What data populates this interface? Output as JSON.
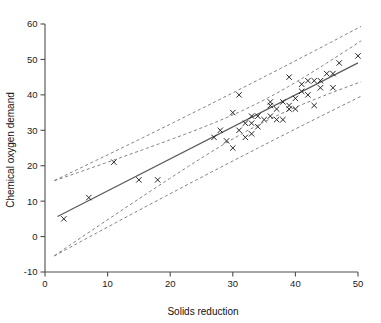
{
  "chart_data": {
    "type": "scatter",
    "title": "",
    "xlabel": "Solids reduction",
    "ylabel": "Chemical oxygen demand",
    "xlim": [
      0,
      50
    ],
    "ylim": [
      -10,
      60
    ],
    "xticks": [
      0,
      10,
      20,
      30,
      40,
      50
    ],
    "yticks": [
      -10,
      0,
      10,
      20,
      30,
      40,
      50,
      60
    ],
    "xtick_labels": [
      "0",
      "10",
      "20",
      "30",
      "40",
      "50"
    ],
    "ytick_labels": [
      "-10",
      "0",
      "10",
      "20",
      "30",
      "40",
      "50",
      "60"
    ],
    "grid": false,
    "legend": false,
    "marker": "x",
    "points": [
      {
        "x": 3.0,
        "y": 5.0
      },
      {
        "x": 7.0,
        "y": 11.0
      },
      {
        "x": 11.0,
        "y": 21.0
      },
      {
        "x": 15.0,
        "y": 16.0
      },
      {
        "x": 18.0,
        "y": 16.0
      },
      {
        "x": 27.0,
        "y": 28.0
      },
      {
        "x": 29.0,
        "y": 27.0
      },
      {
        "x": 30.0,
        "y": 25.0
      },
      {
        "x": 30.0,
        "y": 35.0
      },
      {
        "x": 31.0,
        "y": 30.0
      },
      {
        "x": 31.0,
        "y": 40.0
      },
      {
        "x": 32.0,
        "y": 32.0
      },
      {
        "x": 33.0,
        "y": 34.0
      },
      {
        "x": 33.0,
        "y": 32.0
      },
      {
        "x": 34.0,
        "y": 34.0
      },
      {
        "x": 36.0,
        "y": 37.0
      },
      {
        "x": 36.0,
        "y": 38.0
      },
      {
        "x": 36.0,
        "y": 34.0
      },
      {
        "x": 37.0,
        "y": 36.0
      },
      {
        "x": 38.0,
        "y": 38.0
      },
      {
        "x": 39.0,
        "y": 37.0
      },
      {
        "x": 39.0,
        "y": 36.0
      },
      {
        "x": 39.0,
        "y": 45.0
      },
      {
        "x": 40.0,
        "y": 39.0
      },
      {
        "x": 41.0,
        "y": 41.0
      },
      {
        "x": 42.0,
        "y": 40.0
      },
      {
        "x": 42.0,
        "y": 44.0
      },
      {
        "x": 43.0,
        "y": 37.0
      },
      {
        "x": 44.0,
        "y": 44.0
      },
      {
        "x": 45.0,
        "y": 46.0
      },
      {
        "x": 46.0,
        "y": 46.0
      },
      {
        "x": 47.0,
        "y": 49.0
      },
      {
        "x": 50.0,
        "y": 51.0
      },
      {
        "x": 28.0,
        "y": 30.0
      },
      {
        "x": 34.0,
        "y": 31.0
      },
      {
        "x": 35.0,
        "y": 33.0
      },
      {
        "x": 37.0,
        "y": 33.0
      },
      {
        "x": 41.0,
        "y": 43.0
      },
      {
        "x": 44.0,
        "y": 42.0
      },
      {
        "x": 33.0,
        "y": 29.0
      },
      {
        "x": 32.0,
        "y": 28.0
      },
      {
        "x": 38.0,
        "y": 33.0
      },
      {
        "x": 40.0,
        "y": 36.0
      },
      {
        "x": 43.0,
        "y": 44.0
      },
      {
        "x": 46.0,
        "y": 42.0
      }
    ],
    "fit_line": {
      "name": "least-squares regression line",
      "intercept": 3.83,
      "slope": 0.904,
      "x_start": 2.0,
      "x_end": 50.0
    },
    "bands": [
      {
        "name": "upper prediction band",
        "offset_at_mid": 9.6,
        "kind": "prediction",
        "sign": 1
      },
      {
        "name": "upper confidence band",
        "offset_at_mid": 3.1,
        "kind": "confidence",
        "sign": 1
      },
      {
        "name": "lower confidence band",
        "offset_at_mid": 3.1,
        "kind": "confidence",
        "sign": -1
      },
      {
        "name": "lower prediction band",
        "offset_at_mid": 9.6,
        "kind": "prediction",
        "sign": -1
      }
    ],
    "colors": {
      "marker": "#1c1c1c",
      "fit_line": "#58585e",
      "band_line": "#7a7a80",
      "axis": "#4d4d4d",
      "background": "#ffffff"
    }
  }
}
